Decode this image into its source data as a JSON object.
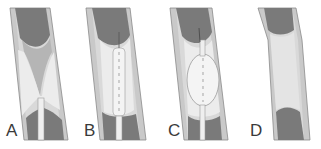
{
  "figure": {
    "panels": [
      {
        "id": "A",
        "label": "A",
        "description": "Narrowed vessel with guidewire catheter inserted"
      },
      {
        "id": "B",
        "label": "B",
        "description": "Deflated balloon catheter positioned in stenosis"
      },
      {
        "id": "C",
        "label": "C",
        "description": "Balloon inflated, widening the vessel"
      },
      {
        "id": "D",
        "label": "D",
        "description": "Vessel lumen restored after balloon removed"
      }
    ]
  },
  "colors": {
    "vessel_wall": "#c9c9c9",
    "vessel_wall_edge": "#8a8a8a",
    "lumen_dark": "#7a7a7a",
    "plaque": "#e6e6e6",
    "plaque_shadow": "#b5b5b5",
    "catheter": "#efefef",
    "balloon": "#f4f4f4",
    "label": "#3a3a3a"
  }
}
